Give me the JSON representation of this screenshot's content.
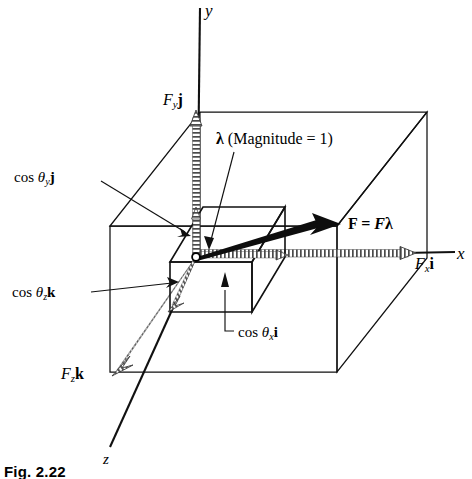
{
  "figure": {
    "caption": "Fig. 2.22",
    "axes": {
      "y": "y",
      "x": "x",
      "z": "z"
    },
    "labels": {
      "force_y_component": "Fᵧ j",
      "force_y_main": "F",
      "force_y_sub": "y",
      "force_y_unit": "j",
      "force_x_main": "F",
      "force_x_sub": "x",
      "force_x_unit": "i",
      "force_z_main": "F",
      "force_z_sub": "z",
      "force_z_unit": "k",
      "lambda_symbol": "λ",
      "lambda_note": " (Magnitude = 1)",
      "force_equation_bold_F": "F",
      "force_equation_equals": " = ",
      "force_equation_italic_F": "F",
      "force_equation_lambda": "λ",
      "dir_cos_y_prefix": "cos ",
      "dir_cos_y_theta": "θ",
      "dir_cos_y_sub": "y",
      "dir_cos_y_unit": "j",
      "dir_cos_z_prefix": "cos ",
      "dir_cos_z_theta": "θ",
      "dir_cos_z_sub": "z",
      "dir_cos_z_unit": "k",
      "dir_cos_x_prefix": "cos ",
      "dir_cos_x_theta": "θ",
      "dir_cos_x_sub": "x",
      "dir_cos_x_unit": "i"
    },
    "colors": {
      "ink": "#000000",
      "line": "#1a1a1a",
      "hatch": "#5a5a5a",
      "background": "#ffffff"
    },
    "geometry": {
      "origin": {
        "x": 196,
        "y": 257
      },
      "axis_y_top": {
        "x": 200,
        "y": 8
      },
      "axis_x_right": {
        "x": 455,
        "y": 252
      },
      "axis_z_end": {
        "x": 110,
        "y": 447
      },
      "force_tip": {
        "x": 340,
        "y": 225
      },
      "fy_arrow_tip": {
        "x": 196,
        "y": 112
      },
      "fx_arrow_tip": {
        "x": 410,
        "y": 252
      },
      "fz_arrow_tip": {
        "x": 112,
        "y": 370
      }
    }
  }
}
